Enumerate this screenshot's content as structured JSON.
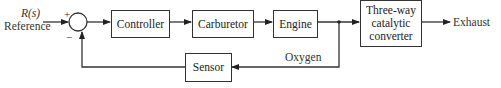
{
  "diagram": {
    "type": "feedback-control-block-diagram",
    "input": {
      "symbol": "R(s)",
      "label": "Reference"
    },
    "summing_junction": {
      "plus_sign": "+",
      "minus_sign": "−"
    },
    "blocks": [
      {
        "id": "controller",
        "label": "Controller"
      },
      {
        "id": "carburetor",
        "label": "Carburetor"
      },
      {
        "id": "engine",
        "label": "Engine"
      },
      {
        "id": "converter",
        "label_lines": [
          "Three-way",
          "catalytic",
          "converter"
        ]
      },
      {
        "id": "sensor",
        "label": "Sensor"
      }
    ],
    "signals": {
      "output": "Exhaust",
      "feedback": "Oxygen"
    },
    "colors": {
      "line": "#333333",
      "text": "#222222",
      "background": "#ffffff"
    }
  }
}
